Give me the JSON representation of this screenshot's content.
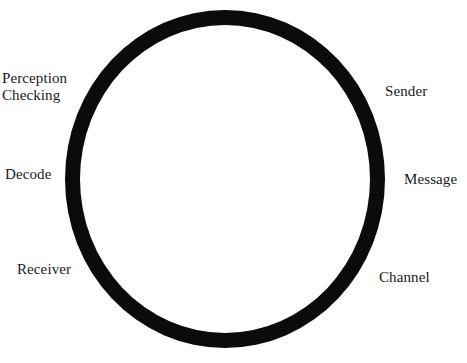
{
  "diagram": {
    "type": "cycle-diagram",
    "shape": "circle",
    "title": "",
    "background_color": "#ffffff",
    "stroke_color": "#0b0b0b",
    "text_color": "#1a1a1a",
    "stroke_width_px": 15,
    "labels": [
      {
        "id": "perception-checking",
        "text": "Perception\nChecking",
        "side": "left",
        "position": "upper-left"
      },
      {
        "id": "decode",
        "text": "Decode",
        "side": "left",
        "position": "mid-left"
      },
      {
        "id": "receiver",
        "text": "Receiver",
        "side": "left",
        "position": "lower-left"
      },
      {
        "id": "sender",
        "text": "Sender",
        "side": "right",
        "position": "upper-right"
      },
      {
        "id": "message",
        "text": "Message",
        "side": "right",
        "position": "mid-right"
      },
      {
        "id": "channel",
        "text": "Channel",
        "side": "right",
        "position": "lower-right"
      }
    ]
  }
}
